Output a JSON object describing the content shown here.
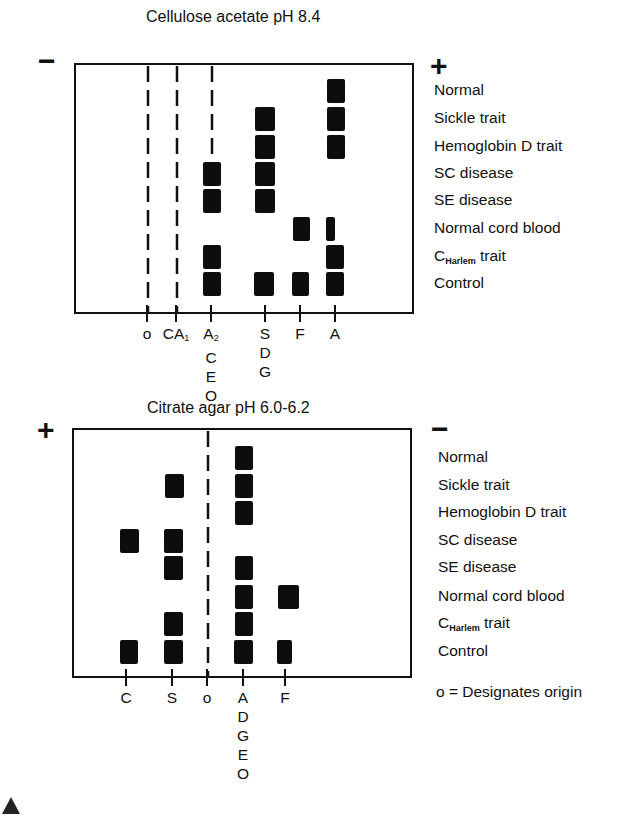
{
  "panels": [
    {
      "id": "top",
      "title": "Cellulose acetate pH 8.4",
      "left_sign": "−",
      "right_sign": "+",
      "box": {
        "x": 75,
        "y": 64,
        "w": 338,
        "h": 249
      },
      "title_pos": {
        "x": 146,
        "y": 8
      },
      "left_sign_pos": {
        "x": 38,
        "y": 46
      },
      "right_sign_pos": {
        "x": 430,
        "y": 51
      },
      "origin_dashes": [
        {
          "x": 148,
          "y1": 66,
          "y2": 313
        },
        {
          "x": 177,
          "y1": 66,
          "y2": 313
        },
        {
          "x": 212,
          "y1": 66,
          "y2": 156
        }
      ],
      "ticks": [
        {
          "x": 147,
          "lines": [
            "o"
          ],
          "sub": ""
        },
        {
          "x": 176,
          "lines": [
            "CA"
          ],
          "sub": "1"
        },
        {
          "x": 211,
          "lines": [
            "A",
            "C",
            "E",
            "O"
          ],
          "sub": "2"
        },
        {
          "x": 265,
          "lines": [
            "S",
            "D",
            "G"
          ],
          "sub": ""
        },
        {
          "x": 300,
          "lines": [
            "F"
          ],
          "sub": ""
        },
        {
          "x": 335,
          "lines": [
            "A"
          ],
          "sub": ""
        }
      ],
      "rows": [
        {
          "label": "Normal",
          "y": 79
        },
        {
          "label": "Sickle trait",
          "y": 107
        },
        {
          "label": "Hemoglobin D trait",
          "y": 135
        },
        {
          "label": "SC disease",
          "y": 162
        },
        {
          "label": "SE disease",
          "y": 189
        },
        {
          "label": "Normal cord blood",
          "y": 217
        },
        {
          "label": "C",
          "label_sub": "Harlem",
          "label_suffix": " trait",
          "y": 245
        },
        {
          "label": "Control",
          "y": 272
        }
      ],
      "labels_x": 434,
      "bands": [
        {
          "row": 0,
          "x": 327,
          "w": 18
        },
        {
          "row": 1,
          "x": 255,
          "w": 20
        },
        {
          "row": 1,
          "x": 327,
          "w": 18
        },
        {
          "row": 2,
          "x": 255,
          "w": 20
        },
        {
          "row": 2,
          "x": 327,
          "w": 18
        },
        {
          "row": 3,
          "x": 203,
          "w": 18
        },
        {
          "row": 3,
          "x": 255,
          "w": 20
        },
        {
          "row": 4,
          "x": 203,
          "w": 18
        },
        {
          "row": 4,
          "x": 255,
          "w": 20
        },
        {
          "row": 5,
          "x": 293,
          "w": 17
        },
        {
          "row": 5,
          "x": 326,
          "w": 9
        },
        {
          "row": 6,
          "x": 203,
          "w": 18
        },
        {
          "row": 6,
          "x": 326,
          "w": 18
        },
        {
          "row": 7,
          "x": 203,
          "w": 18
        },
        {
          "row": 7,
          "x": 254,
          "w": 20
        },
        {
          "row": 7,
          "x": 292,
          "w": 17
        },
        {
          "row": 7,
          "x": 326,
          "w": 18
        }
      ],
      "band_h": 24
    },
    {
      "id": "bottom",
      "title": "Citrate agar pH 6.0-6.2",
      "left_sign": "+",
      "right_sign": "−",
      "box": {
        "x": 73,
        "y": 429,
        "w": 338,
        "h": 248
      },
      "title_pos": {
        "x": 147,
        "y": 399
      },
      "left_sign_pos": {
        "x": 37,
        "y": 415
      },
      "right_sign_pos": {
        "x": 431,
        "y": 414
      },
      "origin_dashes": [
        {
          "x": 208,
          "y1": 431,
          "y2": 677
        }
      ],
      "ticks": [
        {
          "x": 126,
          "lines": [
            "C"
          ],
          "sub": ""
        },
        {
          "x": 172,
          "lines": [
            "S"
          ],
          "sub": ""
        },
        {
          "x": 207,
          "lines": [
            "o"
          ],
          "sub": ""
        },
        {
          "x": 243,
          "lines": [
            "A",
            "D",
            "G",
            "E",
            "O"
          ],
          "sub": ""
        },
        {
          "x": 285,
          "lines": [
            "F"
          ],
          "sub": ""
        }
      ],
      "rows": [
        {
          "label": "Normal",
          "y": 446
        },
        {
          "label": "Sickle trait",
          "y": 474
        },
        {
          "label": "Hemoglobin D trait",
          "y": 501
        },
        {
          "label": "SC disease",
          "y": 529
        },
        {
          "label": "SE disease",
          "y": 556
        },
        {
          "label": "Normal cord blood",
          "y": 585
        },
        {
          "label": "C",
          "label_sub": "Harlem",
          "label_suffix": " trait",
          "y": 612
        },
        {
          "label": "Control",
          "y": 640
        }
      ],
      "labels_x": 438,
      "bands": [
        {
          "row": 0,
          "x": 235,
          "w": 18
        },
        {
          "row": 1,
          "x": 165,
          "w": 19
        },
        {
          "row": 1,
          "x": 235,
          "w": 18
        },
        {
          "row": 2,
          "x": 235,
          "w": 18
        },
        {
          "row": 3,
          "x": 120,
          "w": 19
        },
        {
          "row": 3,
          "x": 164,
          "w": 19
        },
        {
          "row": 4,
          "x": 164,
          "w": 19
        },
        {
          "row": 4,
          "x": 235,
          "w": 18
        },
        {
          "row": 5,
          "x": 235,
          "w": 18
        },
        {
          "row": 5,
          "x": 278,
          "w": 21
        },
        {
          "row": 6,
          "x": 164,
          "w": 19
        },
        {
          "row": 6,
          "x": 235,
          "w": 18
        },
        {
          "row": 7,
          "x": 120,
          "w": 18
        },
        {
          "row": 7,
          "x": 164,
          "w": 19
        },
        {
          "row": 7,
          "x": 234,
          "w": 19
        },
        {
          "row": 7,
          "x": 277,
          "w": 15
        }
      ],
      "band_h": 24
    }
  ],
  "footnote": {
    "text": "o = Designates origin",
    "x": 436,
    "y": 683
  },
  "colors": {
    "ink": "#111111",
    "band": "#0d0d0d",
    "background": "#ffffff"
  }
}
